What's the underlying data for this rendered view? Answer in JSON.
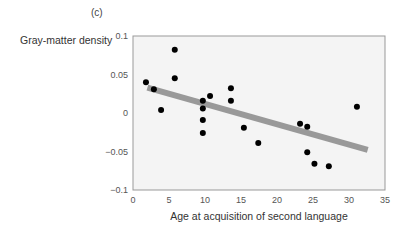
{
  "panel_label": "(c)",
  "chart_data": {
    "type": "scatter",
    "title": "(c)",
    "xlabel": "Age at acquisition of second language",
    "ylabel": "Gray-matter density",
    "xlim": [
      0,
      35
    ],
    "ylim": [
      -0.1,
      0.1
    ],
    "xticks": [
      0,
      5,
      10,
      15,
      20,
      25,
      30,
      35
    ],
    "yticks": [
      -0.1,
      -0.05,
      0,
      0.05,
      0.1
    ],
    "ytick_labels": [
      "−0.1",
      "−0.05",
      "0",
      "0.05",
      "0.1"
    ],
    "grid": false,
    "legend": null,
    "series": [
      {
        "name": "participants",
        "points": [
          {
            "x": 1.8,
            "y": 0.04
          },
          {
            "x": 2.9,
            "y": 0.031
          },
          {
            "x": 3.9,
            "y": 0.004
          },
          {
            "x": 5.8,
            "y": 0.082
          },
          {
            "x": 5.8,
            "y": 0.045
          },
          {
            "x": 9.7,
            "y": 0.016
          },
          {
            "x": 9.7,
            "y": 0.006
          },
          {
            "x": 9.7,
            "y": -0.009
          },
          {
            "x": 9.7,
            "y": -0.026
          },
          {
            "x": 10.7,
            "y": 0.022
          },
          {
            "x": 13.6,
            "y": 0.032
          },
          {
            "x": 13.6,
            "y": 0.016
          },
          {
            "x": 15.4,
            "y": -0.019
          },
          {
            "x": 17.4,
            "y": -0.039
          },
          {
            "x": 23.2,
            "y": -0.014
          },
          {
            "x": 24.2,
            "y": -0.018
          },
          {
            "x": 24.2,
            "y": -0.051
          },
          {
            "x": 25.2,
            "y": -0.066
          },
          {
            "x": 27.2,
            "y": -0.069
          },
          {
            "x": 31.1,
            "y": 0.008
          }
        ]
      }
    ],
    "regression_line": {
      "x": [
        2.0,
        32.6
      ],
      "y": [
        0.033,
        -0.048
      ],
      "color": "#999999"
    },
    "colors": {
      "points": "#000000",
      "line": "#999999",
      "plot_bg": "#f4f4f4",
      "axis": "#999999"
    }
  }
}
